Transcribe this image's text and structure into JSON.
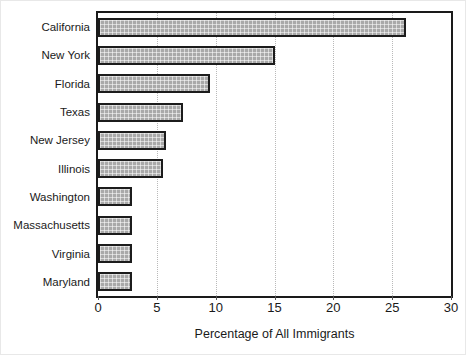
{
  "chart_data": {
    "type": "bar",
    "orientation": "horizontal",
    "title": "",
    "xlabel": "Percentage of All Immigrants",
    "ylabel": "",
    "xlim": [
      0,
      30
    ],
    "xticks": [
      0,
      5,
      10,
      15,
      20,
      25,
      30
    ],
    "xtick_labels": [
      "0",
      "5",
      "10",
      "15",
      "20",
      "25",
      "30"
    ],
    "grid": "vertical dotted gridlines at each x tick",
    "legend": "none",
    "categories": [
      "California",
      "New York",
      "Florida",
      "Texas",
      "New Jersey",
      "Illinois",
      "Washington",
      "Massachusetts",
      "Virginia",
      "Maryland"
    ],
    "values": [
      26.2,
      15.0,
      9.5,
      7.2,
      5.8,
      5.5,
      2.9,
      2.9,
      2.9,
      2.9
    ],
    "bar_fill_color": "#a9a9a9",
    "bar_edge_color": "#1c1c1c",
    "plot_border_color": "#1a1a1a",
    "gridline_color": "#b9b9b9",
    "background_color": "#ffffff"
  }
}
